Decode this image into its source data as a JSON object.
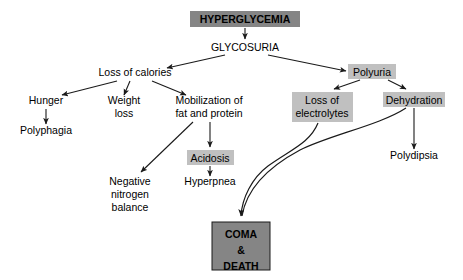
{
  "diagram": {
    "canvas": {
      "width": 463,
      "height": 280
    },
    "colors": {
      "background": "#ffffff",
      "dark_fill": "#858585",
      "light_fill": "#c0c0c0",
      "text": "#000000",
      "stroke": "#1a1a1a"
    },
    "nodes": [
      {
        "id": "hyperglycemia",
        "label": "HYPERGLYCEMIA",
        "lines": [
          "HYPERGLYCEMIA"
        ],
        "style": "dark-box",
        "bold": true,
        "box": {
          "x": 190,
          "y": 11,
          "w": 110,
          "h": 16
        },
        "text_center_x": 245,
        "first_baseline_y": 23,
        "line_height": 13,
        "font_size": 11
      },
      {
        "id": "glycosuria",
        "label": "GLYCOSURIA",
        "lines": [
          "GLYCOSURIA"
        ],
        "style": "plain",
        "bold": false,
        "text_center_x": 245,
        "first_baseline_y": 51,
        "line_height": 12,
        "font_size": 11
      },
      {
        "id": "loss-of-calories",
        "label": "Loss of calories",
        "lines": [
          "Loss of calories"
        ],
        "style": "plain",
        "bold": false,
        "text_center_x": 135,
        "first_baseline_y": 76,
        "line_height": 12,
        "font_size": 10.5
      },
      {
        "id": "polyuria",
        "label": "Polyuria",
        "lines": [
          "Polyuria"
        ],
        "style": "light-box",
        "bold": false,
        "box": {
          "x": 348,
          "y": 64,
          "w": 48,
          "h": 15
        },
        "text_center_x": 372,
        "first_baseline_y": 76,
        "line_height": 12,
        "font_size": 10.5
      },
      {
        "id": "hunger",
        "label": "Hunger",
        "lines": [
          "Hunger"
        ],
        "style": "plain",
        "bold": false,
        "text_center_x": 46,
        "first_baseline_y": 104,
        "line_height": 12,
        "font_size": 10.5
      },
      {
        "id": "polyphagia",
        "label": "Polyphagia",
        "lines": [
          "Polyphagia"
        ],
        "style": "plain",
        "bold": false,
        "text_center_x": 46,
        "first_baseline_y": 134,
        "line_height": 12,
        "font_size": 10.5
      },
      {
        "id": "weight-loss",
        "label": "Weight loss",
        "lines": [
          "Weight",
          "loss"
        ],
        "style": "plain",
        "bold": false,
        "text_center_x": 124,
        "first_baseline_y": 104,
        "line_height": 13,
        "font_size": 10.5
      },
      {
        "id": "mobilization",
        "label": "Mobilization of fat and protein",
        "lines": [
          "Mobilization of",
          "fat and protein"
        ],
        "style": "plain",
        "bold": false,
        "text_center_x": 209,
        "first_baseline_y": 104,
        "line_height": 13,
        "font_size": 10.5
      },
      {
        "id": "loss-of-electrolytes",
        "label": "Loss of electrolytes",
        "lines": [
          "Loss of",
          "electrolytes"
        ],
        "style": "light-box",
        "bold": false,
        "box": {
          "x": 292,
          "y": 92,
          "w": 61,
          "h": 30
        },
        "text_center_x": 322,
        "first_baseline_y": 104,
        "line_height": 13,
        "font_size": 10.5
      },
      {
        "id": "dehydration",
        "label": "Dehydration",
        "lines": [
          "Dehydration"
        ],
        "style": "light-box",
        "bold": false,
        "box": {
          "x": 383,
          "y": 92,
          "w": 62,
          "h": 15
        },
        "text_center_x": 414,
        "first_baseline_y": 104,
        "line_height": 12,
        "font_size": 10.5
      },
      {
        "id": "polydipsia",
        "label": "Polydipsia",
        "lines": [
          "Polydipsia"
        ],
        "style": "plain",
        "bold": false,
        "text_center_x": 414,
        "first_baseline_y": 159,
        "line_height": 12,
        "font_size": 10.5
      },
      {
        "id": "acidosis",
        "label": "Acidosis",
        "lines": [
          "Acidosis"
        ],
        "style": "light-box",
        "bold": false,
        "box": {
          "x": 187,
          "y": 150,
          "w": 47,
          "h": 15
        },
        "text_center_x": 210,
        "first_baseline_y": 162,
        "line_height": 12,
        "font_size": 10.5
      },
      {
        "id": "hyperpnea",
        "label": "Hyperpnea",
        "lines": [
          "Hyperpnea"
        ],
        "style": "plain",
        "bold": false,
        "text_center_x": 210,
        "first_baseline_y": 185,
        "line_height": 12,
        "font_size": 10.5
      },
      {
        "id": "negative-nitrogen-balance",
        "label": "Negative nitrogen balance",
        "lines": [
          "Negative",
          "nitrogen",
          "balance"
        ],
        "style": "plain",
        "bold": false,
        "text_center_x": 130,
        "first_baseline_y": 185,
        "line_height": 13,
        "font_size": 10.5
      },
      {
        "id": "coma-death",
        "label": "COMA & DEATH",
        "lines": [
          "COMA",
          "&",
          "DEATH"
        ],
        "style": "dark-box-outlined",
        "bold": true,
        "box": {
          "x": 212,
          "y": 222,
          "w": 58,
          "h": 48
        },
        "text_center_x": 241,
        "first_baseline_y": 238,
        "line_height": 16,
        "font_size": 11
      }
    ],
    "edges": [
      {
        "id": "hyperglycemia-to-glycosuria",
        "from": "hyperglycemia",
        "to": "glycosuria",
        "type": "line",
        "path": "M 245 28 L 245 39",
        "arrow": true
      },
      {
        "id": "glycosuria-to-loss-of-calories",
        "from": "glycosuria",
        "to": "loss-of-calories",
        "type": "line",
        "path": "M 225 55 L 167 68",
        "arrow": true
      },
      {
        "id": "glycosuria-to-polyuria",
        "from": "glycosuria",
        "to": "polyuria",
        "type": "line",
        "path": "M 268 55 L 346 71",
        "arrow": true
      },
      {
        "id": "loss-of-calories-to-hunger",
        "from": "loss-of-calories",
        "to": "hunger",
        "type": "line",
        "path": "M 117 81 L 62 95",
        "arrow": true
      },
      {
        "id": "loss-of-calories-to-weight-loss",
        "from": "loss-of-calories",
        "to": "weight-loss",
        "type": "line",
        "path": "M 130 81 L 124 95",
        "arrow": true
      },
      {
        "id": "loss-of-calories-to-mobilization",
        "from": "loss-of-calories",
        "to": "mobilization",
        "type": "line",
        "path": "M 152 81 L 186 95",
        "arrow": true
      },
      {
        "id": "hunger-to-polyphagia",
        "from": "hunger",
        "to": "polyphagia",
        "type": "line",
        "path": "M 46 109 L 46 124",
        "arrow": true
      },
      {
        "id": "mobilization-to-negative-nitrogen",
        "from": "mobilization",
        "to": "negative-nitrogen-balance",
        "type": "line",
        "path": "M 193 122 L 141 172",
        "arrow": true
      },
      {
        "id": "mobilization-to-acidosis",
        "from": "mobilization",
        "to": "acidosis",
        "type": "line",
        "path": "M 210 122 L 210 147",
        "arrow": true
      },
      {
        "id": "acidosis-to-hyperpnea",
        "from": "acidosis",
        "to": "hyperpnea",
        "type": "line",
        "path": "M 210 166 L 210 176",
        "arrow": true
      },
      {
        "id": "polyuria-to-loss-of-electrolytes",
        "from": "polyuria",
        "to": "loss-of-electrolytes",
        "type": "line",
        "path": "M 360 80 L 334 89",
        "arrow": true
      },
      {
        "id": "polyuria-to-dehydration",
        "from": "polyuria",
        "to": "dehydration",
        "type": "line",
        "path": "M 388 80 L 406 89",
        "arrow": true
      },
      {
        "id": "dehydration-to-polydipsia",
        "from": "dehydration",
        "to": "polydipsia",
        "type": "line",
        "path": "M 414 108 L 414 149",
        "arrow": true
      },
      {
        "id": "loss-of-electrolytes-to-coma",
        "from": "loss-of-electrolytes",
        "to": "coma-death",
        "type": "curve",
        "path": "M 318 123 C 310 143 290 150 268 166 C 252 178 242 198 241 216",
        "arrow": true
      },
      {
        "id": "dehydration-to-coma",
        "from": "dehydration",
        "to": "coma-death",
        "type": "curve",
        "path": "M 406 108 C 380 125 330 135 300 150 C 272 165 247 186 242 216",
        "arrow": false
      }
    ]
  }
}
